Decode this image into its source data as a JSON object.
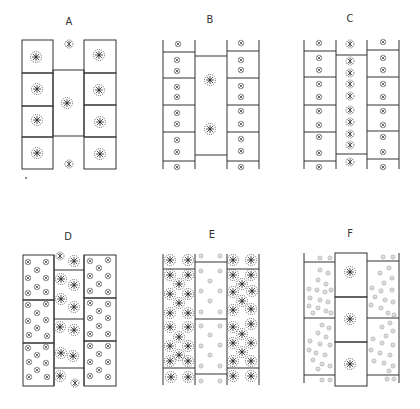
{
  "figure": {
    "panels": [
      {
        "id": "A",
        "label": "A",
        "label_x": 69,
        "label_y": 15
      },
      {
        "id": "B",
        "label": "B",
        "label_x": 210,
        "label_y": 13
      },
      {
        "id": "C",
        "label": "C",
        "label_x": 350,
        "label_y": 12
      },
      {
        "id": "D",
        "label": "D",
        "label_x": 68,
        "label_y": 230
      },
      {
        "id": "E",
        "label": "E",
        "label_x": 212,
        "label_y": 228
      },
      {
        "id": "F",
        "label": "F",
        "label_x": 350,
        "label_y": 227
      }
    ],
    "colors": {
      "line": "#333333",
      "cell_stroke": "#444444",
      "background": "#ffffff"
    }
  }
}
